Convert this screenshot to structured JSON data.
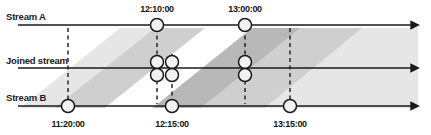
{
  "figure": {
    "type": "stream-join-timeline-diagram",
    "width": 431,
    "height": 135,
    "background": "#ffffff",
    "line_color": "#1a1a1a",
    "dash_color": "#1a1a1a",
    "node_fill": "#f2f2f2",
    "node_stroke": "#1a1a1a",
    "band_light": "#e6e6e6",
    "band_mid": "#cfcfcf",
    "band_dark": "#b8b8b8"
  },
  "lanes": [
    {
      "id": "stream-a",
      "label": "Stream A",
      "y": 25,
      "label_x": 6,
      "label_y": 12
    },
    {
      "id": "joined-stream",
      "label": "Joined stream",
      "y": 68,
      "label_x": 6,
      "label_y": 56
    },
    {
      "id": "stream-b",
      "label": "Stream B",
      "y": 106,
      "label_x": 6,
      "label_y": 93
    }
  ],
  "axis": {
    "x_start": 18,
    "x_end": 418,
    "arrow_size": 5
  },
  "top_time_labels": [
    {
      "text": "12:10:00",
      "x": 157,
      "y": 5
    },
    {
      "text": "13:00:00",
      "x": 245,
      "y": 5
    }
  ],
  "bottom_time_labels": [
    {
      "text": "11:20:00",
      "x": 68,
      "y": 120
    },
    {
      "text": "12:15:00",
      "x": 172,
      "y": 120
    },
    {
      "text": "13:15:00",
      "x": 290,
      "y": 120
    }
  ],
  "guides": [
    {
      "id": "guide-11-20",
      "x": 68,
      "y1": 28,
      "y2": 104
    },
    {
      "id": "guide-12-10",
      "x": 157,
      "y1": 28,
      "y2": 104
    },
    {
      "id": "guide-12-15",
      "x": 172,
      "y1": 54,
      "y2": 104
    },
    {
      "id": "guide-13-00",
      "x": 245,
      "y1": 28,
      "y2": 104
    },
    {
      "id": "guide-13-15",
      "x": 290,
      "y1": 28,
      "y2": 104
    }
  ],
  "events": [
    {
      "id": "a-1210",
      "lane": "stream-a",
      "time": "12:10:00",
      "x": 157,
      "y": 25,
      "r": 6.5
    },
    {
      "id": "a-1300",
      "lane": "stream-a",
      "time": "13:00:00",
      "x": 245,
      "y": 25,
      "r": 6.5
    },
    {
      "id": "b-1120",
      "lane": "stream-b",
      "time": "11:20:00",
      "x": 68,
      "y": 106,
      "r": 6.5
    },
    {
      "id": "b-1215",
      "lane": "stream-b",
      "time": "12:15:00",
      "x": 172,
      "y": 106,
      "r": 6.5
    },
    {
      "id": "b-1315",
      "lane": "stream-b",
      "time": "13:15:00",
      "x": 290,
      "y": 106,
      "r": 6.5
    },
    {
      "id": "j-1210-top",
      "lane": "joined-stream",
      "time": "12:10:00",
      "x": 157,
      "y": 62,
      "r": 6.5
    },
    {
      "id": "j-1210-bot",
      "lane": "joined-stream",
      "time": "12:10:00",
      "x": 157,
      "y": 75,
      "r": 6.5
    },
    {
      "id": "j-1215-top",
      "lane": "joined-stream",
      "time": "12:15:00",
      "x": 172,
      "y": 62,
      "r": 6.5
    },
    {
      "id": "j-1215-bot",
      "lane": "joined-stream",
      "time": "12:15:00",
      "x": 172,
      "y": 75,
      "r": 6.5
    },
    {
      "id": "j-1300-top",
      "lane": "joined-stream",
      "time": "13:00:00",
      "x": 245,
      "y": 62,
      "r": 6.5
    },
    {
      "id": "j-1300-bot",
      "lane": "joined-stream",
      "time": "13:00:00",
      "x": 245,
      "y": 75,
      "r": 6.5
    }
  ],
  "bands": [
    {
      "id": "band-light-left",
      "shade": "light",
      "points": "18,110 120,28 200,28 98,110"
    },
    {
      "id": "band-mid-left",
      "shade": "mid",
      "points": "52,110 155,28 205,28 102,110"
    },
    {
      "id": "band-light-right",
      "shade": "light",
      "points": "168,110 268,28 418,28 418,110"
    },
    {
      "id": "band-mid-right",
      "shade": "mid",
      "points": "196,110 296,28 418,28 418,110"
    },
    {
      "id": "band-dark-wedge",
      "shade": "dark",
      "points": "150,110 252,28 300,28 198,110"
    },
    {
      "id": "band-light-far",
      "shade": "light",
      "points": "262,110 362,28 418,28 418,110"
    }
  ]
}
